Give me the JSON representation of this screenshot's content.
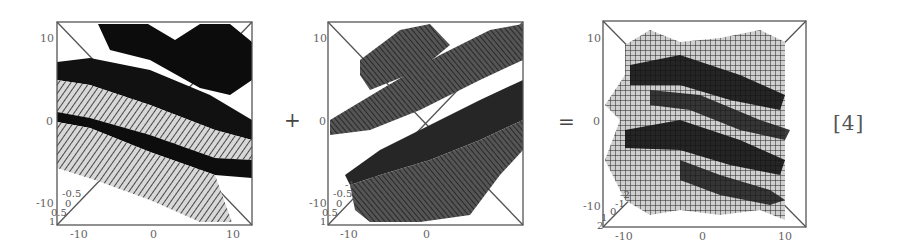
{
  "figure": {
    "operators": {
      "plus": "+",
      "equals": "="
    },
    "reference_label": "[4]",
    "panels": [
      {
        "id": "left-wave",
        "description": "3D mesh surface of a plane wave (bands oriented top-left to bottom-right)",
        "x_ticks": [
          "-10",
          "0",
          "10"
        ],
        "y_ticks": [
          "10",
          "0",
          "-10"
        ],
        "z_ticks": [
          "-0.5",
          "0",
          "0.5",
          "1"
        ]
      },
      {
        "id": "middle-wave",
        "description": "3D mesh surface of a plane wave (bands oriented bottom-left to top-right)",
        "x_ticks": [
          "-10",
          "0"
        ],
        "y_ticks": [
          "10",
          "0",
          "-10"
        ],
        "z_ticks": [
          "-1",
          "-0.5",
          "0",
          "0.5",
          "1"
        ]
      },
      {
        "id": "sum-wave",
        "description": "3D mesh surface showing the superposition (interference pattern) of the two waves",
        "x_ticks": [
          "-10",
          "0",
          "10"
        ],
        "y_ticks": [
          "10",
          "0",
          "-10"
        ],
        "z_ticks": [
          "-2",
          "-1",
          "0",
          "1",
          "2"
        ]
      }
    ]
  },
  "colors": {
    "frame": "#555555",
    "mesh_dark": "#111111",
    "mesh_light": "#9a9a9a",
    "background": "#ffffff"
  }
}
